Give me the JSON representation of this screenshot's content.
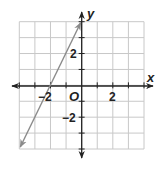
{
  "chart_data": {
    "type": "line",
    "title": "",
    "xlabel": "x",
    "ylabel": "y",
    "origin_label": "O",
    "xlim": [
      -4,
      4
    ],
    "ylim": [
      -4,
      4
    ],
    "grid": true,
    "grid_step": 1,
    "x_tick_labels": [
      {
        "value": -2,
        "label": "−2"
      },
      {
        "value": 2,
        "label": "2"
      }
    ],
    "y_tick_labels": [
      {
        "value": 2,
        "label": "2"
      },
      {
        "value": -2,
        "label": "−2"
      }
    ],
    "series": [
      {
        "name": "line",
        "equation": "y = 2x + 4",
        "slope": 2,
        "intercept": 4,
        "points": [
          {
            "x": -4,
            "y": -4
          },
          {
            "x": -2,
            "y": 0
          },
          {
            "x": 0,
            "y": 4
          }
        ],
        "arrows_both_ends": true,
        "color": "#8a8a8a"
      }
    ],
    "legend": null
  },
  "labels": {
    "x_axis": "x",
    "y_axis": "y",
    "origin": "O",
    "x_neg2": "−2",
    "x_pos2": "2",
    "y_pos2": "2",
    "y_neg2": "−2"
  },
  "colors": {
    "grid": "#c8c8c8",
    "axis": "#222222",
    "line": "#8a8a8a"
  }
}
